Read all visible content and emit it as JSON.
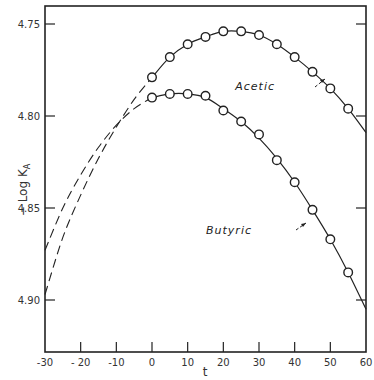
{
  "chart_data": {
    "type": "line",
    "title": "",
    "xlabel": "t",
    "ylabel": "− Log K_A",
    "xlim": [
      -30,
      60
    ],
    "ylim": [
      4.92,
      4.74
    ],
    "y_inverted": true,
    "grid": false,
    "x_ticks": [
      -30,
      -20,
      -10,
      0,
      10,
      20,
      30,
      40,
      50,
      60
    ],
    "x_tick_labels": [
      "-30",
      "- 20",
      "-10",
      "0",
      "10",
      "20",
      "30",
      "40",
      "50",
      "60"
    ],
    "y_ticks": [
      4.75,
      4.8,
      4.85,
      4.9
    ],
    "y_tick_labels": [
      "4.75",
      "4.80",
      "4.85",
      "4.90"
    ],
    "series": [
      {
        "name": "Acetic",
        "marker": "open-circle",
        "x": [
          0,
          5,
          10,
          15,
          20,
          25,
          30,
          35,
          40,
          45,
          50,
          55
        ],
        "values": [
          4.779,
          4.768,
          4.761,
          4.757,
          4.754,
          4.754,
          4.756,
          4.761,
          4.768,
          4.776,
          4.785,
          4.796
        ],
        "solid_fit_x": [
          0,
          5,
          10,
          15,
          20,
          25,
          30,
          35,
          40,
          45,
          50,
          55,
          60
        ],
        "solid_fit_y": [
          4.779,
          4.768,
          4.761,
          4.757,
          4.754,
          4.754,
          4.756,
          4.761,
          4.768,
          4.776,
          4.785,
          4.796,
          4.809
        ],
        "extrapolated_dashed_x": [
          -30,
          -25,
          -20,
          -15,
          -10,
          -5,
          0
        ],
        "extrapolated_dashed_y": [
          4.897,
          4.866,
          4.843,
          4.823,
          4.806,
          4.791,
          4.779
        ],
        "label_position": {
          "t": 35,
          "value": 4.782
        }
      },
      {
        "name": "Butyric",
        "marker": "open-circle",
        "x": [
          0,
          5,
          10,
          15,
          20,
          25,
          30,
          35,
          40,
          45,
          50,
          55
        ],
        "values": [
          4.79,
          4.788,
          4.788,
          4.789,
          4.797,
          4.803,
          4.81,
          4.824,
          4.836,
          4.851,
          4.867,
          4.885
        ],
        "solid_fit_x": [
          0,
          5,
          10,
          15,
          20,
          25,
          30,
          35,
          40,
          45,
          50,
          55,
          60
        ],
        "solid_fit_y": [
          4.79,
          4.788,
          4.788,
          4.79,
          4.796,
          4.803,
          4.812,
          4.823,
          4.836,
          4.851,
          4.867,
          4.885,
          4.905
        ],
        "extrapolated_dashed_x": [
          -30,
          -25,
          -20,
          -15,
          -10,
          -5,
          0
        ],
        "extrapolated_dashed_y": [
          4.873,
          4.85,
          4.832,
          4.817,
          4.805,
          4.796,
          4.79
        ],
        "label_position": {
          "t": 30,
          "value": 4.866
        }
      }
    ],
    "annotations": [
      {
        "text": "Acetic",
        "arrow_to": {
          "t": 44,
          "value": 4.778
        }
      },
      {
        "text": "Butyric",
        "arrow_to": {
          "t": 44,
          "value": 4.855
        }
      }
    ]
  },
  "axes": {
    "x_label": "t",
    "y_label_main": "− Log K",
    "y_label_sub": "A"
  }
}
